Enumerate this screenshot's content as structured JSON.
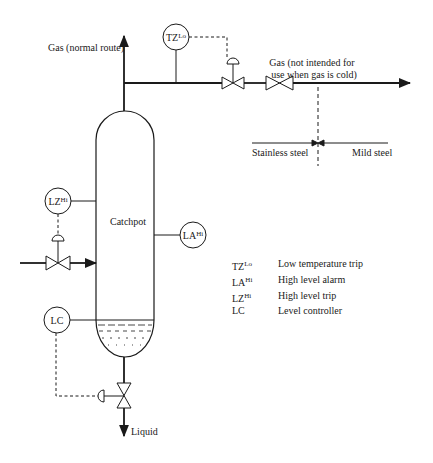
{
  "diagram": {
    "vessel_label": "Catchpot",
    "streams": {
      "gas_normal": "Gas (normal route)",
      "gas_alt_line1": "Gas (not intended for",
      "gas_alt_line2": "use when gas is cold)",
      "liquid": "Liquid"
    },
    "materials": {
      "left": "Stainless steel",
      "right": "Mild steel"
    },
    "instruments": {
      "tz": {
        "base": "TZ",
        "sup": "Lo"
      },
      "lz": {
        "base": "LZ",
        "sup": "Hi"
      },
      "la": {
        "base": "LA",
        "sup": "Hi"
      },
      "lc": {
        "base": "LC",
        "sup": ""
      }
    },
    "legend": [
      {
        "base": "TZ",
        "sup": "Lo",
        "description": "Low temperature trip"
      },
      {
        "base": "LA",
        "sup": "Hi",
        "description": "High level alarm"
      },
      {
        "base": "LZ",
        "sup": "Hi",
        "description": "High level trip"
      },
      {
        "base": "LC",
        "sup": "",
        "description": "Level controller"
      }
    ],
    "colors": {
      "line": "#1a1a1a",
      "background": "#ffffff"
    }
  }
}
